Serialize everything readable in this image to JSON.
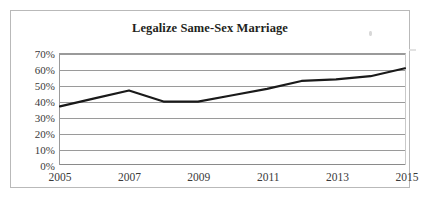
{
  "chart_data": {
    "type": "line",
    "title": "Legalize Same-Sex Marriage",
    "xlabel": "",
    "ylabel": "",
    "x": [
      2005,
      2006,
      2007,
      2008,
      2009,
      2010,
      2011,
      2012,
      2013,
      2014,
      2015
    ],
    "values": [
      37,
      42,
      47,
      40,
      40,
      44,
      48,
      53,
      54,
      56,
      61
    ],
    "series": [
      {
        "name": "Legalize Same-Sex Marriage",
        "values": [
          37,
          42,
          47,
          40,
          40,
          44,
          48,
          53,
          54,
          56,
          61
        ]
      }
    ],
    "xlim": [
      2005,
      2015
    ],
    "ylim": [
      0,
      70
    ],
    "x_tick_labels": [
      "2005",
      "2007",
      "2009",
      "2011",
      "2013",
      "2015"
    ],
    "x_tick_values": [
      2005,
      2007,
      2009,
      2011,
      2013,
      2015
    ],
    "y_tick_labels": [
      "0%",
      "10%",
      "20%",
      "30%",
      "40%",
      "50%",
      "60%",
      "70%"
    ],
    "y_tick_values": [
      0,
      10,
      20,
      30,
      40,
      50,
      60,
      70
    ],
    "grid": true,
    "legend": false,
    "legend_position": "none",
    "line_color": "#1a1a1a",
    "grid_color": "#9a9a9a",
    "background_color": "#ffffff",
    "border_color": "#b9b9b9",
    "markers": false,
    "annotations": []
  }
}
